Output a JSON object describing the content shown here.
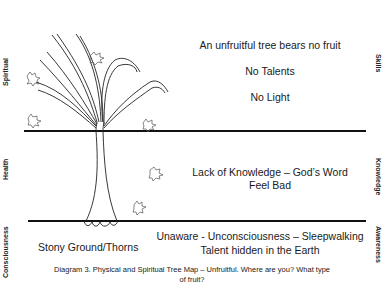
{
  "diagram": {
    "left_labels": {
      "top": "Spiritual",
      "middle": "Health",
      "bottom": "Consciousness"
    },
    "right_labels": {
      "top": "Skills",
      "middle": "Knowledge",
      "bottom": "Awareness"
    },
    "upper_zone": {
      "line1": "An unfruitful tree bears no fruit",
      "line2": "No Talents",
      "line3": "No Light"
    },
    "middle_zone": {
      "line1": "Lack of Knowledge – God’s Word",
      "line2": "Feel Bad"
    },
    "lower_zone": {
      "left_text": "Stony Ground/Thorns",
      "line1": "Unaware - Unconsciousness – Sleepwalking",
      "line2": "Talent hidden in the Earth"
    },
    "caption": {
      "line1": "Diagram 3. Physical and Spiritual Tree Map – Unfruitful. Where are you? What type",
      "line2": "of fruit?"
    },
    "colors": {
      "line": "#111111",
      "text": "#1a1a1a",
      "background": "#ffffff"
    }
  }
}
